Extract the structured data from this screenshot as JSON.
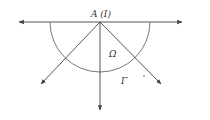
{
  "diagram": {
    "labels": {
      "apex": "A (I)",
      "region": "Ω",
      "boundary": "Γ"
    },
    "colors": {
      "stroke": "#444444",
      "text": "#333333",
      "background": "#ffffff"
    },
    "geometry": {
      "apex": [
        100,
        22
      ],
      "semicircle_radius": 50,
      "horizontal_line": [
        [
          18,
          22
        ],
        [
          183,
          22
        ]
      ],
      "rays": [
        [
          [
            100,
            22
          ],
          [
            40,
            85
          ]
        ],
        [
          [
            100,
            22
          ],
          [
            100,
            110
          ]
        ],
        [
          [
            100,
            22
          ],
          [
            162,
            85
          ]
        ]
      ]
    }
  }
}
